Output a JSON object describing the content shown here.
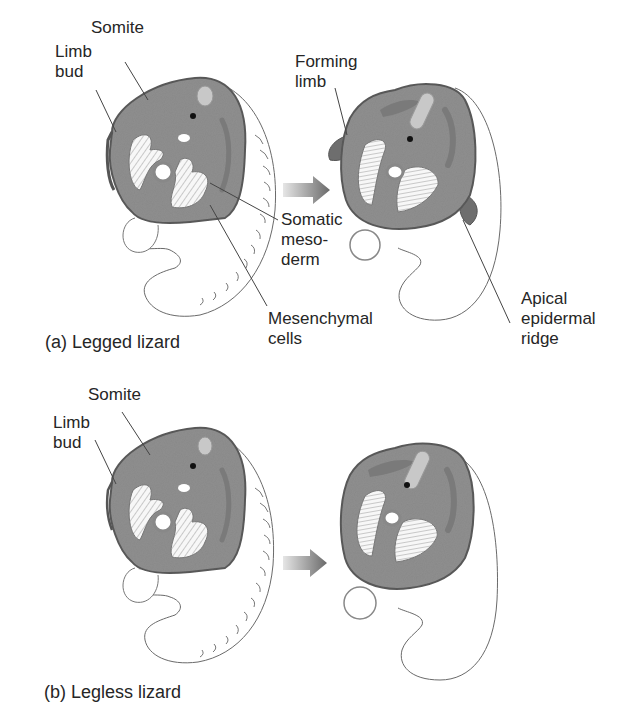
{
  "figure": {
    "panels": [
      {
        "id": "a",
        "caption": "(a) Legged lizard",
        "labels": {
          "somite": "Somite",
          "limb_bud_line1": "Limb",
          "limb_bud_line2": "bud",
          "forming_limb_line1": "Forming",
          "forming_limb_line2": "limb",
          "somatic_mesoderm_line1": "Somatic",
          "somatic_mesoderm_line2": "meso-",
          "somatic_mesoderm_line3": "derm",
          "mesenchymal_cells_line1": "Mesenchymal",
          "mesenchymal_cells_line2": "cells",
          "aer_line1": "Apical",
          "aer_line2": "epidermal",
          "aer_line3": "ridge"
        }
      },
      {
        "id": "b",
        "caption": "(b) Legless lizard",
        "labels": {
          "somite": "Somite",
          "limb_bud_line1": "Limb",
          "limb_bud_line2": "bud"
        }
      }
    ],
    "icons": {
      "arrow": "right-arrow-icon"
    },
    "colors": {
      "tissue": "#8f8f8f",
      "tissue_dark": "#6e6e6e",
      "outline": "#555555",
      "muscle": "#f4f4f4",
      "arrow": "#7a7a7a",
      "text": "#262626"
    }
  }
}
